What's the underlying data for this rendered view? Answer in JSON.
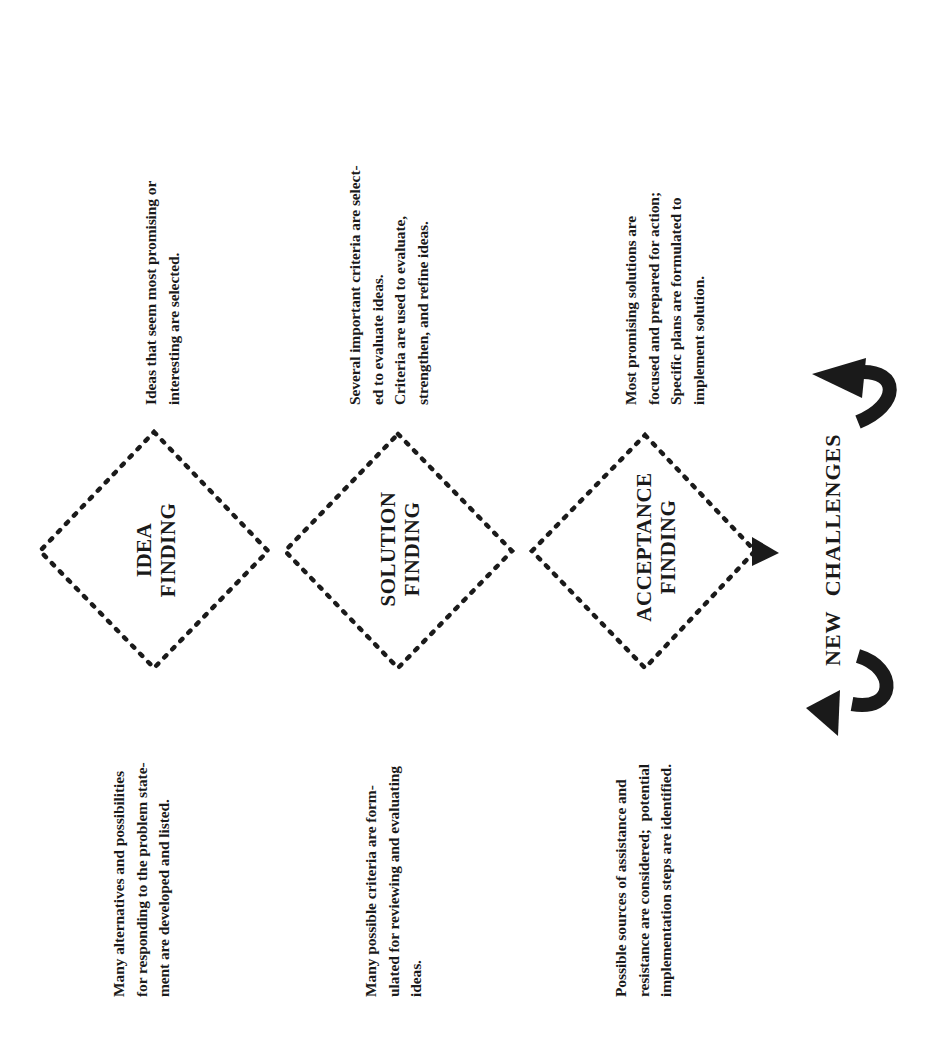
{
  "diagram": {
    "orientation": "rotated 90 degrees counterclockwise",
    "stages": [
      {
        "id": "idea-finding",
        "title": "IDEA\nFINDING",
        "divergent_text": "Many alternatives and possibilities\nfor responding to the problem state-\nment are developed and listed.",
        "convergent_text": "Ideas that seem most promising or\ninteresting are selected."
      },
      {
        "id": "solution-finding",
        "title": "SOLUTION\nFINDING",
        "divergent_text": "Many possible criteria are form-\nulated for reviewing and evaluating\nideas.",
        "convergent_text": "Several important criteria are select-\ned to evaluate ideas.\nCriteria are used to evaluate,\nstrengthen, and refine ideas."
      },
      {
        "id": "acceptance-finding",
        "title": "ACCEPTANCE\nFINDING",
        "divergent_text": "Possible sources of assistance and\nresistance are considered;  potential\nimplementation steps are identified.",
        "convergent_text": "Most promising solutions are\nfocused and prepared for action;\nSpecific plans are formulated to\nimplement solution."
      }
    ],
    "footer": {
      "label": "NEW CHALLENGES",
      "icons": [
        "curved-arrow-left-icon",
        "curved-arrow-right-icon"
      ]
    },
    "colors": {
      "ink": "#1a1a1a",
      "background": "#ffffff"
    }
  }
}
